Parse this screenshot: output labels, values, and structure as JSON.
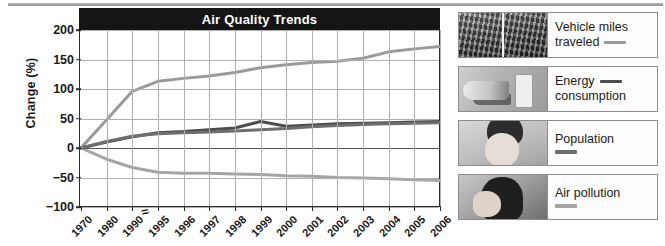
{
  "chart_data": {
    "type": "line",
    "title": "Air Quality Trends",
    "xlabel": "",
    "ylabel": "Change (%)",
    "ylim": [
      -100,
      200
    ],
    "yticks": [
      200,
      150,
      100,
      50,
      0,
      -50,
      -100
    ],
    "grid": true,
    "legend_position": "right",
    "axis_break_after": "1990",
    "categories": [
      "1970",
      "1980",
      "1990",
      "1995",
      "1996",
      "1997",
      "1998",
      "1999",
      "2000",
      "2001",
      "2002",
      "2003",
      "2004",
      "2005",
      "2006"
    ],
    "series": [
      {
        "name": "Vehicle miles traveled",
        "color": "#9a9a9a",
        "values": [
          0,
          48,
          96,
          113,
          118,
          122,
          128,
          136,
          141,
          145,
          147,
          152,
          163,
          168,
          172
        ]
      },
      {
        "name": "Energy consumption",
        "color": "#4d4d4d",
        "values": [
          0,
          10,
          19,
          26,
          28,
          31,
          34,
          45,
          37,
          39,
          41,
          42,
          43,
          44,
          45
        ]
      },
      {
        "name": "Population",
        "color": "#6e6e6e",
        "values": [
          0,
          11,
          20,
          24,
          26,
          27,
          29,
          31,
          33,
          36,
          38,
          40,
          41,
          42,
          43
        ]
      },
      {
        "name": "Air pollution",
        "color": "#a5a5a5",
        "values": [
          0,
          -19,
          -33,
          -41,
          -43,
          -43,
          -44,
          -45,
          -47,
          -48,
          -50,
          -51,
          -52,
          -54,
          -55
        ]
      }
    ]
  },
  "legend": {
    "items": [
      {
        "label_line1": "Vehicle miles",
        "label_line2": "traveled",
        "swatch_color": "#9a9a9a",
        "thumb": "traffic-jam-photo",
        "swatch_after": "line2"
      },
      {
        "label_line1": "Energy",
        "label_line2": "consumption",
        "swatch_color": "#4d4d4d",
        "thumb": "hand-light-switch-photo",
        "swatch_after": "line1"
      },
      {
        "label_line1": "Population",
        "label_line2": "",
        "swatch_color": "#6e6e6e",
        "thumb": "baby-photo",
        "swatch_after": "below"
      },
      {
        "label_line1": "Air pollution",
        "label_line2": "",
        "swatch_color": "#a5a5a5",
        "thumb": "person-coughing-photo",
        "swatch_after": "below"
      }
    ]
  }
}
